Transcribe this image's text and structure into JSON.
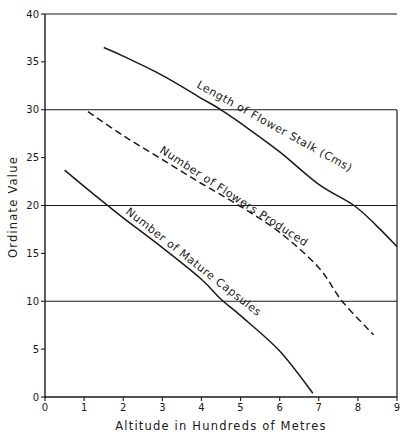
{
  "chart_data": {
    "type": "line",
    "title": "",
    "xlabel": "Altitude in Hundreds of Metres",
    "ylabel": "Ordinate Value",
    "xlim": [
      0,
      9
    ],
    "ylim": [
      0,
      40
    ],
    "x_ticks": [
      "0",
      "1",
      "2",
      "3",
      "4",
      "5",
      "6",
      "7",
      "8",
      "9"
    ],
    "y_ticks": [
      "0",
      "5",
      "10",
      "15",
      "20",
      "25",
      "30",
      "35",
      "40"
    ],
    "gridlines_y": [
      10,
      20,
      30,
      40
    ],
    "grid": "horizontal at 10, 20, 30, 40",
    "legend": "inline curve labels",
    "series": [
      {
        "name": "Length of Flower Stalk (Cms)",
        "style": "solid",
        "x": [
          1.5,
          2,
          3,
          4,
          4.5,
          5,
          6,
          7,
          7.9,
          8.5,
          9
        ],
        "y": [
          36.5,
          35.6,
          33.6,
          31.2,
          30,
          28.6,
          25.6,
          22.2,
          20,
          17.8,
          15.7
        ]
      },
      {
        "name": "Number of Flowers Produced",
        "style": "dashed",
        "x": [
          1.1,
          2,
          3,
          4,
          5,
          6,
          7,
          7.6,
          8.4
        ],
        "y": [
          29.8,
          27.3,
          24.8,
          22.3,
          19.9,
          17.2,
          13.5,
          10,
          6.5
        ]
      },
      {
        "name": "Number of Mature Capsules",
        "style": "solid",
        "x": [
          0.5,
          1,
          1.6,
          2,
          3,
          4,
          4.5,
          5,
          6,
          6.85
        ],
        "y": [
          23.7,
          22,
          20,
          18.7,
          15.6,
          12.3,
          10.2,
          8.5,
          4.8,
          0.4
        ]
      }
    ]
  },
  "labels": {
    "xlabel": "Altitude in Hundreds of Metres",
    "ylabel": "Ordinate Value",
    "series0": "Length of Flower Stalk (Cms)",
    "series1": "Number of Flowers Produced",
    "series2": "Number of Mature Capsules"
  },
  "colors": {
    "ink": "#1a1a1a",
    "background": "#ffffff"
  }
}
